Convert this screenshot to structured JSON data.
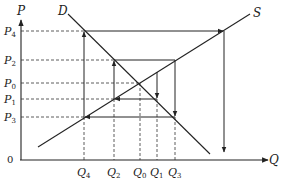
{
  "diagram": {
    "axes": {
      "y_label": "P",
      "x_label": "Q",
      "origin_label": "0"
    },
    "curves": {
      "demand_label": "D",
      "supply_label": "S"
    },
    "price_levels": [
      {
        "main": "P",
        "sub": "4",
        "y": 31
      },
      {
        "main": "P",
        "sub": "2",
        "y": 60
      },
      {
        "main": "P",
        "sub": "0",
        "y": 83
      },
      {
        "main": "P",
        "sub": "1",
        "y": 99
      },
      {
        "main": "P",
        "sub": "3",
        "y": 117
      }
    ],
    "quantity_levels": [
      {
        "main": "Q",
        "sub": "4",
        "x": 84
      },
      {
        "main": "Q",
        "sub": "2",
        "x": 114
      },
      {
        "main": "Q",
        "sub": "0",
        "x": 140
      },
      {
        "main": "Q",
        "sub": "1",
        "x": 157
      },
      {
        "main": "Q",
        "sub": "3",
        "x": 175
      }
    ],
    "colors": {
      "line": "#222222",
      "background": "#ffffff"
    }
  }
}
